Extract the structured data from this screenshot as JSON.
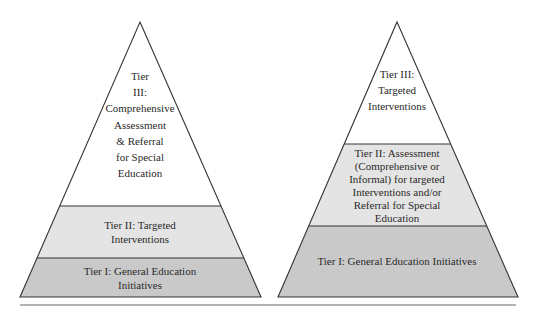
{
  "diagram": {
    "type": "tiered-pyramid-comparison",
    "colors": {
      "tier3_fill": "#ffffff",
      "tier2_fill": "#e4e4e4",
      "tier1_fill": "#c9c9c9",
      "stroke": "#333333",
      "rule": "#999999"
    },
    "pyramids": [
      {
        "id": "left",
        "tiers": [
          {
            "level": "III",
            "label": "Tier\nIII:\nComprehensive\nAssessment\n& Referral\nfor Special\nEducation"
          },
          {
            "level": "II",
            "label": "Tier II: Targeted\nInterventions"
          },
          {
            "level": "I",
            "label": "Tier I: General Education\nInitiatives"
          }
        ]
      },
      {
        "id": "right",
        "tiers": [
          {
            "level": "III",
            "label": "Tier III:\nTargeted\nInterventions"
          },
          {
            "level": "II",
            "label": "Tier II: Assessment\n(Comprehensive or\nInformal) for targeted\nInterventions and/or\nReferral for Special\nEducation"
          },
          {
            "level": "I",
            "label": "Tier I: General Education Initiatives"
          }
        ]
      }
    ]
  }
}
